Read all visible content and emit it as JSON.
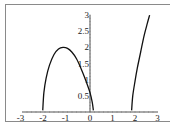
{
  "chart_data": {
    "type": "line",
    "title": "",
    "xlabel": "",
    "ylabel": "",
    "xlim": [
      -3,
      3
    ],
    "ylim": [
      0,
      3
    ],
    "grid": false,
    "x_ticks": [
      "-3",
      "-2",
      "-1",
      "0",
      "1",
      "2",
      "3"
    ],
    "y_ticks": [
      "0.5",
      "1",
      "1.5",
      "2",
      "2.5",
      "3"
    ],
    "series": [
      {
        "name": "branch-1",
        "x": [
          -2.1,
          -2.05,
          -1.95,
          -1.8,
          -1.6,
          -1.4,
          -1.2,
          -1.0,
          -0.8,
          -0.6,
          -0.4,
          -0.2,
          0.0,
          0.1,
          0.15
        ],
        "y": [
          0.05,
          0.6,
          1.05,
          1.45,
          1.78,
          1.95,
          2.0,
          1.97,
          1.85,
          1.65,
          1.35,
          1.0,
          0.6,
          0.3,
          0.05
        ]
      },
      {
        "name": "branch-2",
        "x": [
          1.85,
          1.9,
          2.0,
          2.1,
          2.25,
          2.4,
          2.55,
          2.65
        ],
        "y": [
          0.05,
          0.5,
          0.95,
          1.35,
          1.85,
          2.35,
          2.75,
          3.0
        ]
      }
    ],
    "line_color": "#111111"
  }
}
